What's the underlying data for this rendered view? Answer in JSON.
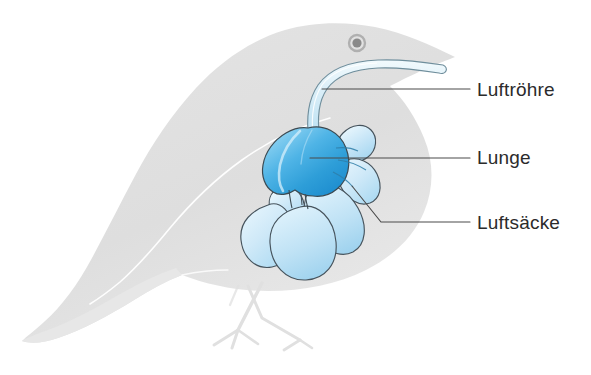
{
  "figure": {
    "background_color": "#ffffff"
  },
  "bird": {
    "silhouette_name": "bird-body-silhouette",
    "body_color": "#dedede",
    "body_color_light": "#e6e6e6",
    "wing_line_color": "#ffffff",
    "eye": {
      "name": "bird-eye",
      "ring_color": "#b4b4b4",
      "pupil_color": "#8c8c8c"
    },
    "legs": {
      "name": "bird-legs",
      "color": "#e3e3e3"
    }
  },
  "anatomy": {
    "trachea": {
      "name": "trachea",
      "fill_light": "#eaf6fc",
      "fill_mid": "#cfe9f6",
      "outline": "#6f8e9c"
    },
    "lung": {
      "name": "lung",
      "fill_light": "#8fd3f2",
      "fill_mid": "#3aa8e0",
      "fill_dark": "#1f8fd0",
      "outline": "#3c4a52",
      "highlight": "#d6effb"
    },
    "air_sacs": {
      "name": "air-sacs",
      "fill_light": "#e2f3fc",
      "fill_mid": "#bfe2f5",
      "fill_dark": "#a6d7f0",
      "outline": "#46535c",
      "count": 6
    }
  },
  "labels": [
    {
      "id": "luftroehre",
      "text": "Luftröhre",
      "target": "trachea",
      "leader_color": "#4a4a4a"
    },
    {
      "id": "lunge",
      "text": "Lunge",
      "target": "lung",
      "leader_color": "#4a4a4a"
    },
    {
      "id": "luftsaecke",
      "text": "Luftsäcke",
      "target": "air-sacs",
      "leader_color": "#4a4a4a"
    }
  ]
}
